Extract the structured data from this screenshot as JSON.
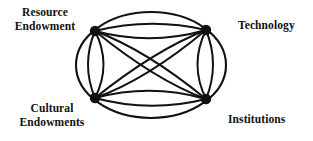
{
  "figure": {
    "stroke_color": "#111111",
    "node_color": "#111111",
    "background_color": "#ffffff",
    "nodes": [
      {
        "id": "resource-endowment",
        "label": "Resource\nEndowment",
        "cx": 95,
        "cy": 31,
        "r": 5.2
      },
      {
        "id": "technology",
        "label": "Technology",
        "cx": 206,
        "cy": 30,
        "r": 5.2
      },
      {
        "id": "cultural-endowments",
        "label": "Cultural\nEndowments",
        "cx": 95,
        "cy": 98,
        "r": 5.2
      },
      {
        "id": "institutions",
        "label": "Institutions",
        "cx": 206,
        "cy": 99,
        "r": 5.2
      }
    ],
    "outer_ellipse": {
      "cx": 151,
      "cy": 65,
      "rx": 75,
      "ry": 53
    },
    "connections": [
      {
        "from": "resource-endowment",
        "to": "technology",
        "style": "lens"
      },
      {
        "from": "cultural-endowments",
        "to": "institutions",
        "style": "lens"
      },
      {
        "from": "resource-endowment",
        "to": "cultural-endowments",
        "style": "lens"
      },
      {
        "from": "technology",
        "to": "institutions",
        "style": "lens"
      },
      {
        "from": "resource-endowment",
        "to": "institutions",
        "style": "lens"
      },
      {
        "from": "technology",
        "to": "cultural-endowments",
        "style": "lens"
      }
    ]
  },
  "labels": {
    "top_left": "Resource\nEndowment",
    "top_right": "Technology",
    "bottom_left": "Cultural\nEndowments",
    "bottom_right": "Institutions"
  }
}
